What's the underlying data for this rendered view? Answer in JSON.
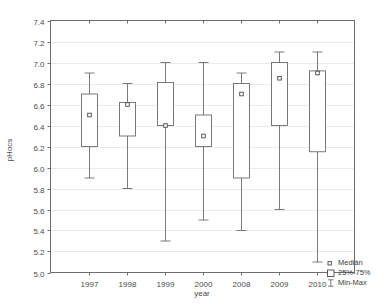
{
  "chart_data": {
    "type": "box",
    "title": "",
    "xlabel": "year",
    "ylabel": "pHocs",
    "categories": [
      "1997",
      "1998",
      "1999",
      "2000",
      "2008",
      "2009",
      "2010"
    ],
    "ylim": [
      5.0,
      7.4
    ],
    "ytick_step": 0.2,
    "ytick_labels": [
      "5.0",
      "5.2",
      "5.4",
      "5.6",
      "5.8",
      "6.0",
      "6.2",
      "6.4",
      "6.6",
      "6.8",
      "7.0",
      "7.2",
      "7.4"
    ],
    "grid": true,
    "legend_position": "bottom-right",
    "legend": [
      {
        "key": "median",
        "label": "Medián",
        "marker": "small-square-dot"
      },
      {
        "key": "iqr",
        "label": "25%-75%",
        "marker": "open-rectangle"
      },
      {
        "key": "range",
        "label": "Min-Max",
        "marker": "i-bar"
      }
    ],
    "boxes": [
      {
        "category": "1997",
        "min": 5.9,
        "q1": 6.2,
        "median": 6.5,
        "q3": 6.7,
        "max": 6.9
      },
      {
        "category": "1998",
        "min": 5.8,
        "q1": 6.3,
        "median": 6.6,
        "q3": 6.62,
        "max": 6.8
      },
      {
        "category": "1999",
        "min": 5.3,
        "q1": 6.4,
        "median": 6.4,
        "q3": 6.81,
        "max": 7.0
      },
      {
        "category": "2000",
        "min": 5.5,
        "q1": 6.2,
        "median": 6.3,
        "q3": 6.5,
        "max": 7.0
      },
      {
        "category": "2008",
        "min": 5.4,
        "q1": 5.9,
        "median": 6.7,
        "q3": 6.8,
        "max": 6.9
      },
      {
        "category": "2009",
        "min": 5.6,
        "q1": 6.4,
        "median": 6.85,
        "q3": 7.0,
        "max": 7.1
      },
      {
        "category": "2010",
        "min": 5.1,
        "q1": 6.15,
        "median": 6.9,
        "q3": 6.92,
        "max": 7.1
      }
    ],
    "colors": {
      "frame": "#6d6d6d",
      "grid": "#e2e2e2",
      "box_stroke": "#6b6b6b",
      "box_fill": "#ffffff",
      "text": "#3a3a3a",
      "background": "#ffffff"
    }
  }
}
